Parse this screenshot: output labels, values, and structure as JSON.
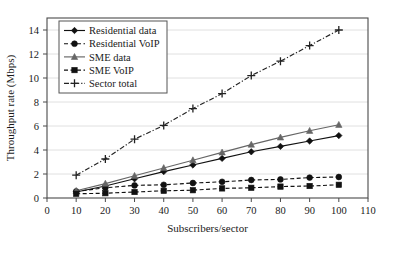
{
  "chart_data": {
    "type": "line",
    "title": "",
    "xlabel": "Subscribers/sector",
    "ylabel": "Throughput rate (Mbps)",
    "xlim": [
      0,
      110
    ],
    "ylim": [
      0,
      15
    ],
    "xticks": [
      0,
      10,
      20,
      30,
      40,
      50,
      60,
      70,
      80,
      90,
      100,
      110
    ],
    "yticks": [
      0,
      2,
      4,
      6,
      8,
      10,
      12,
      14
    ],
    "grid": "horizontal",
    "legend_position": "top-left",
    "x": [
      10,
      20,
      30,
      40,
      50,
      60,
      70,
      80,
      90,
      100
    ],
    "series": [
      {
        "name": "Residential data",
        "values": [
          0.5,
          1.0,
          1.6,
          2.2,
          2.75,
          3.3,
          3.85,
          4.3,
          4.75,
          5.2
        ],
        "marker": "diamond",
        "dash": "solid",
        "color": "#111111"
      },
      {
        "name": "Residential VoIP",
        "values": [
          0.55,
          0.85,
          1.05,
          1.1,
          1.25,
          1.35,
          1.5,
          1.55,
          1.7,
          1.75
        ],
        "marker": "circle",
        "dash": "dashed",
        "color": "#111111"
      },
      {
        "name": "SME data",
        "values": [
          0.6,
          1.2,
          1.85,
          2.5,
          3.15,
          3.8,
          4.45,
          5.05,
          5.6,
          6.1
        ],
        "marker": "triangle",
        "dash": "solid",
        "color": "#666666"
      },
      {
        "name": "SME VoIP",
        "values": [
          0.35,
          0.4,
          0.5,
          0.6,
          0.65,
          0.8,
          0.85,
          0.95,
          1.0,
          1.1
        ],
        "marker": "square",
        "dash": "dashed",
        "color": "#111111"
      },
      {
        "name": "Sector total",
        "values": [
          1.9,
          3.25,
          4.9,
          6.05,
          7.45,
          8.7,
          10.2,
          11.4,
          12.7,
          14.0
        ],
        "marker": "plus",
        "dash": "dashdot",
        "color": "#222222"
      }
    ]
  }
}
